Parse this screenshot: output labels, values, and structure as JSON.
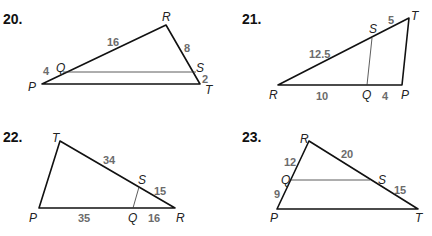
{
  "problems": [
    {
      "number": "20.",
      "vertices": {
        "P": "P",
        "Q": "Q",
        "R": "R",
        "S": "S",
        "T": "T"
      },
      "lengths": {
        "RQ": "16",
        "RS": "8",
        "QP": "4",
        "ST": "2"
      }
    },
    {
      "number": "21.",
      "vertices": {
        "R": "R",
        "S": "S",
        "T": "T",
        "Q": "Q",
        "P": "P"
      },
      "lengths": {
        "RS": "12.5",
        "ST": "5",
        "RQ": "10",
        "QP": "4"
      }
    },
    {
      "number": "22.",
      "vertices": {
        "T": "T",
        "S": "S",
        "P": "P",
        "Q": "Q",
        "R": "R"
      },
      "lengths": {
        "TS": "34",
        "SR": "15",
        "PQ": "35",
        "QR": "16"
      }
    },
    {
      "number": "23.",
      "vertices": {
        "R": "R",
        "Q": "Q",
        "S": "S",
        "P": "P",
        "T": "T"
      },
      "lengths": {
        "RQ": "12",
        "RS": "20",
        "QP": "9",
        "ST": "15"
      }
    }
  ]
}
